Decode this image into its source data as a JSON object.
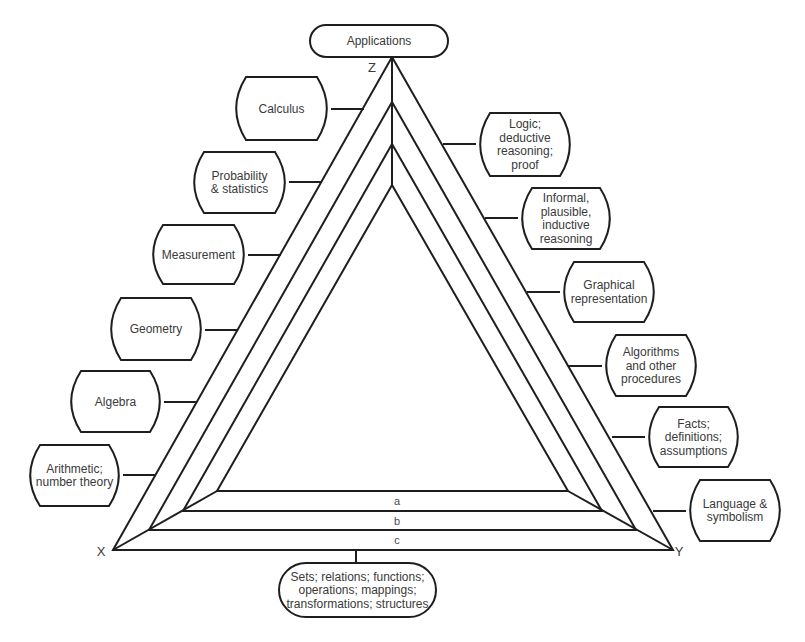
{
  "diagram": {
    "vertices": {
      "x": {
        "label": "X",
        "pos": [
          113,
          550
        ],
        "label_pos": [
          101,
          556
        ]
      },
      "y": {
        "label": "Y",
        "pos": [
          673,
          550
        ],
        "label_pos": [
          679,
          556
        ]
      },
      "z": {
        "label": "Z",
        "pos": [
          392,
          57
        ],
        "label_pos": [
          372,
          72
        ]
      }
    },
    "layers": [
      {
        "name": "outer",
        "apex": [
          392,
          57
        ],
        "left": [
          113,
          550
        ],
        "right": [
          673,
          550
        ],
        "band_label": "c",
        "band_label_pos": [
          397,
          544
        ]
      },
      {
        "name": "b",
        "apex": [
          392,
          102
        ],
        "left": [
          149,
          530
        ],
        "right": [
          636,
          530
        ],
        "band_label": "b",
        "band_label_pos": [
          397,
          525
        ]
      },
      {
        "name": "a",
        "apex": [
          392,
          144
        ],
        "left": [
          183,
          511
        ],
        "right": [
          602,
          511
        ],
        "band_label": "a",
        "band_label_pos": [
          397,
          505
        ]
      },
      {
        "name": "inner",
        "apex": [
          392,
          185
        ],
        "left": [
          217,
          491
        ],
        "right": [
          568,
          491
        ]
      }
    ],
    "top_box": {
      "label_lines": [
        "Applications"
      ],
      "rect": [
        310,
        25,
        138,
        32
      ],
      "connector": [
        [
          392,
          57
        ],
        [
          392,
          57
        ]
      ]
    },
    "bottom_box": {
      "label_lines": [
        "Sets; relations; functions;",
        "operations; mappings;",
        "transformations; structures"
      ],
      "rect": [
        279,
        563,
        157,
        54
      ],
      "connector": [
        [
          356,
          550
        ],
        [
          356,
          563
        ]
      ]
    },
    "left_boxes": [
      {
        "id": "calculus",
        "label_lines": [
          "Calculus"
        ],
        "rect": [
          232,
          77,
          99,
          63
        ],
        "connector": [
          [
            331,
            109
          ],
          [
            364,
            109
          ]
        ]
      },
      {
        "id": "probability-statistics",
        "label_lines": [
          "Probability",
          "& statistics"
        ],
        "rect": [
          190,
          152,
          99,
          61
        ],
        "connector": [
          [
            289,
            182
          ],
          [
            322,
            182
          ]
        ]
      },
      {
        "id": "measurement",
        "label_lines": [
          "Measurement"
        ],
        "rect": [
          149,
          225,
          99,
          59
        ],
        "connector": [
          [
            248,
            255
          ],
          [
            281,
            255
          ]
        ]
      },
      {
        "id": "geometry",
        "label_lines": [
          "Geometry"
        ],
        "rect": [
          107,
          298,
          98,
          62
        ],
        "connector": [
          [
            205,
            330
          ],
          [
            238,
            330
          ]
        ]
      },
      {
        "id": "algebra",
        "label_lines": [
          "Algebra"
        ],
        "rect": [
          67,
          371,
          97,
          61
        ],
        "connector": [
          [
            164,
            402
          ],
          [
            197,
            402
          ]
        ]
      },
      {
        "id": "arithmetic-number-theory",
        "label_lines": [
          "Arithmetic;",
          "number theory"
        ],
        "rect": [
          26,
          445,
          97,
          61
        ],
        "connector": [
          [
            123,
            475
          ],
          [
            156,
            475
          ]
        ]
      }
    ],
    "right_boxes": [
      {
        "id": "logic-deductive",
        "label_lines": [
          "Logic;",
          "deductive",
          "reasoning;",
          "proof"
        ],
        "rect": [
          476,
          113,
          98,
          63
        ],
        "connector": [
          [
            443,
            144
          ],
          [
            476,
            144
          ]
        ]
      },
      {
        "id": "informal-inductive",
        "label_lines": [
          "Informal,",
          "plausible,",
          "inductive",
          "reasoning"
        ],
        "rect": [
          518,
          188,
          96,
          61
        ],
        "connector": [
          [
            485,
            218
          ],
          [
            518,
            218
          ]
        ]
      },
      {
        "id": "graphical-representation",
        "label_lines": [
          "Graphical",
          "representation"
        ],
        "rect": [
          560,
          262,
          98,
          60
        ],
        "connector": [
          [
            527,
            292
          ],
          [
            560,
            292
          ]
        ]
      },
      {
        "id": "algorithms-procedures",
        "label_lines": [
          "Algorithms",
          "and other",
          "procedures"
        ],
        "rect": [
          602,
          335,
          98,
          61
        ],
        "connector": [
          [
            569,
            366
          ],
          [
            602,
            366
          ]
        ]
      },
      {
        "id": "facts-definitions",
        "label_lines": [
          "Facts;",
          "definitions;",
          "assumptions"
        ],
        "rect": [
          645,
          407,
          97,
          60
        ],
        "connector": [
          [
            612,
            437
          ],
          [
            645,
            437
          ]
        ]
      },
      {
        "id": "language-symbolism",
        "label_lines": [
          "Language &",
          "symbolism"
        ],
        "rect": [
          686,
          480,
          98,
          61
        ],
        "connector": [
          [
            653,
            511
          ],
          [
            686,
            511
          ]
        ]
      }
    ],
    "colors": {
      "ink": "#1e1e1e",
      "text": "#3a3a3a",
      "background": "#ffffff"
    }
  }
}
